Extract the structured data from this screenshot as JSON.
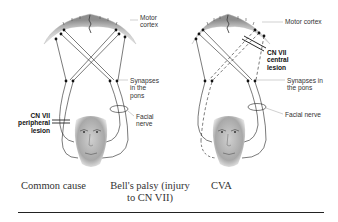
{
  "diagram": {
    "type": "neuroanatomy-comparison",
    "panels": [
      {
        "id": "peripheral",
        "labels": {
          "motor_cortex": "Motor\ncortex",
          "synapses": "Synapses\nin the\npons",
          "facial_nerve": "Facial\nnerve",
          "lesion": "CN VII\nperipheral\nlesion"
        }
      },
      {
        "id": "central",
        "labels": {
          "motor_cortex": "Motor cortex",
          "lesion": "CN VII\ncentral\nlesion",
          "synapses": "Synapses in\nthe pons",
          "facial_nerve": "Facial nerve"
        }
      }
    ],
    "captions": {
      "common_cause": "Common cause",
      "bells_palsy": "Bell's palsy (injury\nto CN VII)",
      "cva": "CVA"
    },
    "colors": {
      "line": "#222222",
      "cortex_gray": "#9a9a9a",
      "face_gray": "#b9b9b9",
      "label_text": "#333333",
      "rule": "#222222"
    }
  }
}
